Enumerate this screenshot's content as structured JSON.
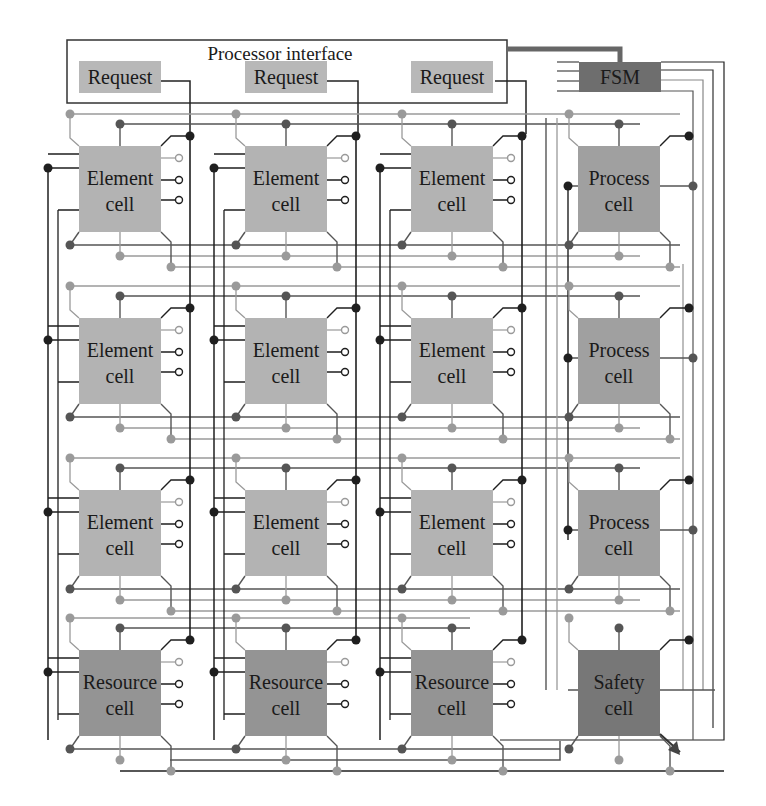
{
  "diagram": {
    "title": "Processor interface",
    "requests": [
      {
        "label": "Request"
      },
      {
        "label": "Request"
      },
      {
        "label": "Request"
      }
    ],
    "fsm": {
      "label": "FSM"
    },
    "grid": [
      [
        {
          "line1": "Element",
          "line2": "cell"
        },
        {
          "line1": "Element",
          "line2": "cell"
        },
        {
          "line1": "Element",
          "line2": "cell"
        },
        {
          "line1": "Process",
          "line2": "cell"
        }
      ],
      [
        {
          "line1": "Element",
          "line2": "cell"
        },
        {
          "line1": "Element",
          "line2": "cell"
        },
        {
          "line1": "Element",
          "line2": "cell"
        },
        {
          "line1": "Process",
          "line2": "cell"
        }
      ],
      [
        {
          "line1": "Element",
          "line2": "cell"
        },
        {
          "line1": "Element",
          "line2": "cell"
        },
        {
          "line1": "Element",
          "line2": "cell"
        },
        {
          "line1": "Process",
          "line2": "cell"
        }
      ],
      [
        {
          "line1": "Resource",
          "line2": "cell"
        },
        {
          "line1": "Resource",
          "line2": "cell"
        },
        {
          "line1": "Resource",
          "line2": "cell"
        },
        {
          "line1": "Safety",
          "line2": "cell"
        }
      ]
    ],
    "colors": {
      "element_fill": "#b3b3b3",
      "process_fill": "#a0a0a0",
      "resource_fill": "#949494",
      "safety_fill": "#777777",
      "fsm_fill": "#6e6e6e",
      "request_fill": "#b8b8b8",
      "wire_dark": "#1f1f1f",
      "wire_mid": "#555555",
      "wire_light": "#9a9a9a"
    }
  }
}
